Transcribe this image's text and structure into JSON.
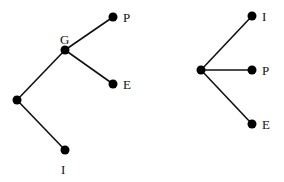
{
  "diagram": {
    "type": "two trees",
    "colors": {
      "edge": "#111111",
      "node": "#000000",
      "background": "#ffffff"
    },
    "left_tree": {
      "labels": {
        "G": "G",
        "P": "P",
        "E": "E",
        "I": "I"
      },
      "nodes": [
        {
          "id": "root",
          "label": ""
        },
        {
          "id": "G",
          "label": "G"
        },
        {
          "id": "P",
          "label": "P"
        },
        {
          "id": "E",
          "label": "E"
        },
        {
          "id": "I",
          "label": "I"
        }
      ],
      "edges": [
        [
          "root",
          "G"
        ],
        [
          "G",
          "P"
        ],
        [
          "G",
          "E"
        ],
        [
          "root",
          "I"
        ]
      ]
    },
    "right_tree": {
      "labels": {
        "I": "I",
        "P": "P",
        "E": "E"
      },
      "nodes": [
        {
          "id": "root",
          "label": ""
        },
        {
          "id": "I",
          "label": "I"
        },
        {
          "id": "P",
          "label": "P"
        },
        {
          "id": "E",
          "label": "E"
        }
      ],
      "edges": [
        [
          "root",
          "I"
        ],
        [
          "root",
          "P"
        ],
        [
          "root",
          "E"
        ]
      ]
    }
  }
}
